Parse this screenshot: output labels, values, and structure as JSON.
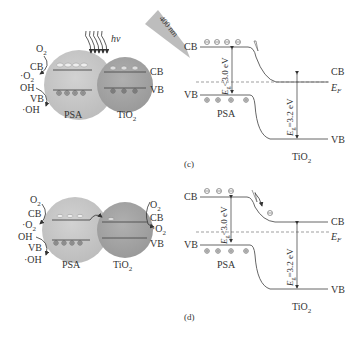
{
  "panel_c": {
    "schematic": {
      "light_label": "hν",
      "wavelength_label": "400 nm",
      "psa_label": "PSA",
      "tio2_label": "TiO",
      "tio2_sub": "2",
      "left_labels": {
        "o2": "O",
        "o2_sub": "2",
        "cb": "CB",
        "superoxide": "·O",
        "superoxide_sub": "2",
        "oh_minus": "OH",
        "vb": "VB",
        "hydroxyl": "·OH"
      },
      "right_labels": {
        "cb": "CB",
        "vb": "VB"
      }
    },
    "band": {
      "cb_left": "CB",
      "vb_left": "VB",
      "cb_right": "CB",
      "vb_right": "VB",
      "ef": "E",
      "ef_sub": "F",
      "eg_psa": "E",
      "eg_psa_sub": "g",
      "eg_psa_val": "<3.0 eV",
      "eg_tio2": "E",
      "eg_tio2_sub": "g",
      "eg_tio2_val": "=3.2 eV",
      "psa_label": "PSA",
      "tio2_label": "TiO",
      "tio2_sub": "2",
      "caption": "(c)"
    }
  },
  "panel_d": {
    "schematic": {
      "psa_label": "PSA",
      "tio2_label": "TiO",
      "tio2_sub": "2",
      "left_labels": {
        "o2": "O",
        "o2_sub": "2",
        "cb": "CB",
        "superoxide": "·O",
        "superoxide_sub": "2",
        "oh_minus": "OH",
        "vb": "VB",
        "hydroxyl": "·OH"
      },
      "right_labels": {
        "o2": "O",
        "o2_sub": "2",
        "cb": "CB",
        "superoxide": "·O",
        "superoxide_sub": "2",
        "vb": "VB"
      }
    },
    "band": {
      "cb_left": "CB",
      "vb_left": "VB",
      "cb_right": "CB",
      "vb_right": "VB",
      "ef": "E",
      "ef_sub": "F",
      "eg_psa": "E",
      "eg_psa_sub": "g",
      "eg_psa_val": "<3.0 eV",
      "eg_tio2": "E",
      "eg_tio2_sub": "g",
      "eg_tio2_val": "=3.2 eV",
      "psa_label": "PSA",
      "tio2_label": "TiO",
      "tio2_sub": "2",
      "caption": "(d)"
    }
  },
  "colors": {
    "psa_sphere": "#c8c8c8",
    "tio2_sphere": "#a8a8a8",
    "line": "#555555",
    "arrow_band": "#b8b8b8"
  }
}
